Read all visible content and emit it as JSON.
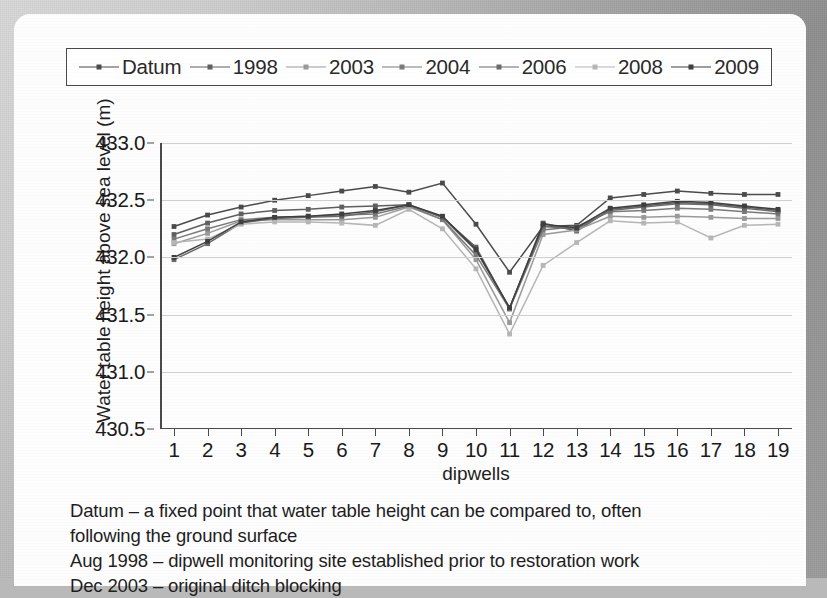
{
  "chart_data": {
    "type": "line",
    "title": "",
    "xlabel": "dipwells",
    "ylabel": "Water table height above sea level (m)",
    "x": [
      1,
      2,
      3,
      4,
      5,
      6,
      7,
      8,
      9,
      10,
      11,
      12,
      13,
      14,
      15,
      16,
      17,
      18,
      19
    ],
    "categories": [
      "1",
      "2",
      "3",
      "4",
      "5",
      "6",
      "7",
      "8",
      "9",
      "10",
      "11",
      "12",
      "13",
      "14",
      "15",
      "16",
      "17",
      "18",
      "19"
    ],
    "ylim": [
      430.5,
      433.0
    ],
    "ytick_labels": [
      "433.0",
      "432.5",
      "432.0",
      "431.5",
      "431.0",
      "430.5"
    ],
    "yticks": [
      433.0,
      432.5,
      432.0,
      431.5,
      431.0,
      430.5
    ],
    "xlim": [
      1,
      19
    ],
    "grid": true,
    "legend_position": "top",
    "series": [
      {
        "name": "Datum",
        "color": "#4b4b4b",
        "values": [
          432.27,
          432.37,
          432.44,
          432.5,
          432.54,
          432.58,
          432.62,
          432.57,
          432.65,
          432.29,
          431.87,
          432.27,
          432.28,
          432.52,
          432.55,
          432.58,
          432.56,
          432.55,
          432.55
        ]
      },
      {
        "name": "1998",
        "color": "#5f5f5f",
        "values": [
          432.2,
          432.3,
          432.38,
          432.41,
          432.42,
          432.44,
          432.45,
          432.46,
          432.35,
          432.09,
          431.55,
          432.3,
          432.23,
          432.42,
          432.45,
          432.48,
          432.47,
          432.44,
          432.41
        ]
      },
      {
        "name": "2003",
        "color": "#9a9a9a",
        "values": [
          432.12,
          432.21,
          432.32,
          432.33,
          432.33,
          432.33,
          432.35,
          432.44,
          432.33,
          431.98,
          431.43,
          432.2,
          432.24,
          432.36,
          432.35,
          432.36,
          432.35,
          432.34,
          432.34
        ]
      },
      {
        "name": "2004",
        "color": "#7a7a7a",
        "values": [
          432.16,
          432.25,
          432.33,
          432.35,
          432.36,
          432.37,
          432.38,
          432.45,
          432.33,
          432.02,
          431.55,
          432.24,
          432.27,
          432.4,
          432.41,
          432.43,
          432.42,
          432.4,
          432.38
        ]
      },
      {
        "name": "2006",
        "color": "#6b6b6b",
        "values": [
          431.98,
          432.12,
          432.3,
          432.34,
          432.35,
          432.36,
          432.4,
          432.46,
          432.35,
          432.06,
          431.56,
          432.27,
          432.25,
          432.41,
          432.44,
          432.47,
          432.46,
          432.43,
          432.4
        ]
      },
      {
        "name": "2008",
        "color": "#b6b6b6",
        "values": [
          432.13,
          432.16,
          432.29,
          432.31,
          432.31,
          432.3,
          432.28,
          432.42,
          432.25,
          431.9,
          431.33,
          431.93,
          432.13,
          432.32,
          432.3,
          432.31,
          432.17,
          432.28,
          432.29
        ]
      },
      {
        "name": "2009",
        "color": "#3f3f3f",
        "values": [
          432.0,
          432.14,
          432.31,
          432.35,
          432.36,
          432.38,
          432.41,
          432.46,
          432.36,
          432.07,
          431.56,
          432.29,
          432.26,
          432.43,
          432.46,
          432.49,
          432.48,
          432.45,
          432.42
        ]
      }
    ]
  },
  "legend": {
    "items": [
      {
        "label": "Datum",
        "color": "#4b4b4b"
      },
      {
        "label": "1998",
        "color": "#5f5f5f"
      },
      {
        "label": "2003",
        "color": "#9a9a9a"
      },
      {
        "label": "2004",
        "color": "#7a7a7a"
      },
      {
        "label": "2006",
        "color": "#6b6b6b"
      },
      {
        "label": "2008",
        "color": "#b6b6b6"
      },
      {
        "label": "2009",
        "color": "#3f3f3f"
      }
    ]
  },
  "caption": {
    "line1": "Datum – a fixed point that water table height can be compared to, often",
    "line2": "following the ground surface",
    "line3": "Aug 1998 – dipwell monitoring site established prior to restoration work",
    "line4": "Dec 2003 – original ditch blocking"
  }
}
